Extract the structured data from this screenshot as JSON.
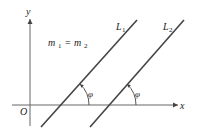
{
  "diagram": {
    "type": "parallel-lines-slope",
    "equation": {
      "m": "m",
      "sub1": "1",
      "eq": "=",
      "sub2": "2"
    },
    "axes": {
      "x_label": "x",
      "y_label": "y",
      "origin_label": "O"
    },
    "lines": [
      {
        "name": "L",
        "sub": "1",
        "angle_label": "φ"
      },
      {
        "name": "L",
        "sub": "2",
        "angle_label": "φ"
      }
    ],
    "colors": {
      "axis": "#555555",
      "line": "#333333",
      "text": "#222222"
    }
  }
}
